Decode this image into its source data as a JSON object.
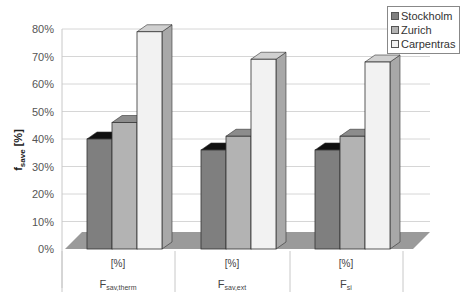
{
  "chart_data": {
    "type": "bar",
    "style": "3d-clustered-column",
    "title": "",
    "xlabel": "",
    "ylabel": "f_save [%]",
    "ylabel_main": "f",
    "ylabel_sub": "save",
    "ylabel_unit": "[%]",
    "ylim": [
      0,
      80
    ],
    "yticks": [
      "0%",
      "10%",
      "20%",
      "30%",
      "40%",
      "50%",
      "60%",
      "70%",
      "80%"
    ],
    "grid": true,
    "legend_position": "top-right",
    "categories": [
      "F_sav,therm",
      "F_sav,ext",
      "F_si"
    ],
    "category_labels": [
      {
        "main": "F",
        "sub": "sav,therm",
        "unit": "[%]"
      },
      {
        "main": "F",
        "sub": "sav,ext",
        "unit": "[%]"
      },
      {
        "main": "F",
        "sub": "si",
        "unit": "[%]"
      }
    ],
    "series": [
      {
        "name": "Stockholm",
        "values": [
          40,
          36,
          36
        ],
        "color": "#7f7f7f",
        "top": "#111111",
        "side": "#4a4a4a"
      },
      {
        "name": "Zurich",
        "values": [
          46,
          41,
          41
        ],
        "color": "#b3b3b3",
        "top": "#8c8c8c",
        "side": "#7a7a7a"
      },
      {
        "name": "Carpentras",
        "values": [
          79,
          69,
          68
        ],
        "color": "#f2f2f2",
        "top": "#d0d0d0",
        "side": "#a8a8a8"
      }
    ]
  },
  "legend": {
    "items": [
      {
        "label": "Stockholm",
        "color": "#7f7f7f"
      },
      {
        "label": "Zurich",
        "color": "#b3b3b3"
      },
      {
        "label": "Carpentras",
        "color": "#f2f2f2"
      }
    ]
  }
}
